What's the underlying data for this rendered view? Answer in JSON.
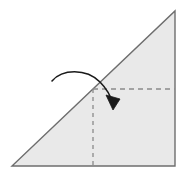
{
  "figure": {
    "canvas": {
      "width": 185,
      "height": 178
    },
    "colors": {
      "background": "#ffffff",
      "shape_fill": "#e9e9e9",
      "shape_stroke": "#6e6e6e",
      "dashed_stroke": "#8a8a8a",
      "arrow_stroke": "#1a1a1a"
    },
    "shape": {
      "name": "right-triangle",
      "type": "polygon",
      "points": "12,166 175,166 175,11",
      "vertices": [
        {
          "label": "bottom-left",
          "x": 12,
          "y": 166
        },
        {
          "label": "bottom-right",
          "x": 175,
          "y": 166
        },
        {
          "label": "top-right",
          "x": 175,
          "y": 11
        }
      ],
      "stroke_width": 1.4
    },
    "fold_lines": [
      {
        "name": "horizontal-fold-line",
        "orientation": "horizontal",
        "x1": 93,
        "y1": 89,
        "x2": 175,
        "y2": 89,
        "dash": "5,4",
        "stroke_width": 1.3
      },
      {
        "name": "vertical-fold-line",
        "orientation": "vertical",
        "x1": 93,
        "y1": 89,
        "x2": 93,
        "y2": 166,
        "dash": "4,4",
        "stroke_width": 1.3
      }
    ],
    "fold_arrow": {
      "name": "fold-direction-arrow",
      "path": "M 52 81 C 62 69, 86 68, 100 82 C 107 89, 111 97, 113 104",
      "stroke_width": 1.6,
      "arrowhead": {
        "points": "113,110 106,95 120,99",
        "tip_x": 113,
        "tip_y": 110
      }
    },
    "intersection_point": {
      "x": 93,
      "y": 89
    }
  }
}
